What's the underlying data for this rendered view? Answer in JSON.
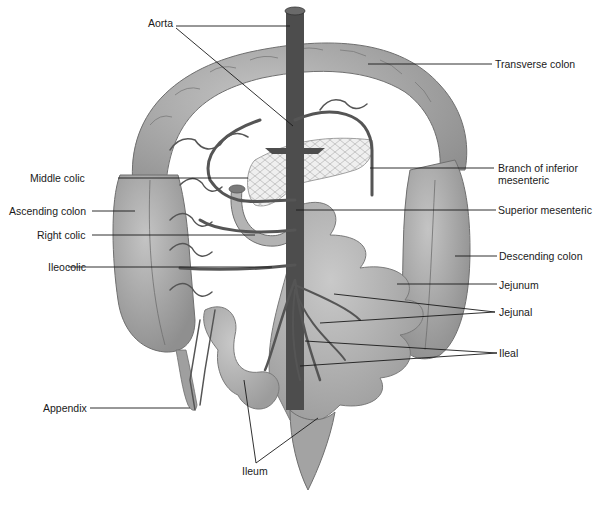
{
  "figure": {
    "colors": {
      "background": "#ffffff",
      "colon_fill": "#a9a9a9",
      "colon_shade": "#8e8e8e",
      "small_intestine_fill": "#b5b5b5",
      "vessel": "#555555",
      "aorta": "#4a4a4a",
      "pancreas": "#ececec",
      "leader_line": "#1a1a1a",
      "label_text": "#1a1a1a"
    }
  },
  "labels": {
    "left": [
      {
        "id": "aorta",
        "text": "Aorta"
      },
      {
        "id": "middle_colic",
        "text": "Middle colic"
      },
      {
        "id": "ascending_colon",
        "text": "Ascending colon"
      },
      {
        "id": "right_colic",
        "text": "Right colic"
      },
      {
        "id": "ileocolic",
        "text": "Ileocolic"
      },
      {
        "id": "appendix",
        "text": "Appendix"
      }
    ],
    "right": [
      {
        "id": "transverse_colon",
        "text": "Transverse colon"
      },
      {
        "id": "branch_inferior_mesenteric_1",
        "text": "Branch of inferior"
      },
      {
        "id": "branch_inferior_mesenteric_2",
        "text": "mesenteric"
      },
      {
        "id": "superior_mesenteric",
        "text": "Superior mesenteric"
      },
      {
        "id": "descending_colon",
        "text": "Descending colon"
      },
      {
        "id": "jejunum",
        "text": "Jejunum"
      },
      {
        "id": "jejunal",
        "text": "Jejunal"
      },
      {
        "id": "ileal",
        "text": "Ileal"
      }
    ],
    "bottom": [
      {
        "id": "ileum",
        "text": "Ileum"
      }
    ]
  }
}
